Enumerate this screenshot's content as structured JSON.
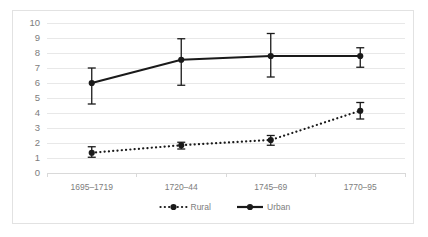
{
  "chart_data": {
    "type": "line",
    "title": "",
    "subtitle": "",
    "xlabel": "",
    "ylabel": "",
    "categories": [
      "1695–1719",
      "1720–44",
      "1745–69",
      "1770–95"
    ],
    "ylim": [
      0,
      10
    ],
    "ytick_step": 1,
    "yticks": [
      "0",
      "1",
      "2",
      "3",
      "4",
      "5",
      "6",
      "7",
      "8",
      "9",
      "10"
    ],
    "grid": true,
    "grid_axis": "y",
    "legend_position": "bottom",
    "series": [
      {
        "name": "Rural",
        "style": "dotted",
        "marker": "circle",
        "color": "#1a1a1a",
        "values": [
          1.35,
          1.85,
          2.2,
          4.15
        ],
        "err_low": [
          1.05,
          1.6,
          1.85,
          3.6
        ],
        "err_high": [
          1.75,
          2.05,
          2.5,
          4.7
        ]
      },
      {
        "name": "Urban",
        "style": "solid",
        "marker": "circle",
        "color": "#1a1a1a",
        "values": [
          6.0,
          7.55,
          7.8,
          7.8
        ],
        "err_low": [
          4.6,
          5.85,
          6.4,
          7.05
        ],
        "err_high": [
          7.0,
          8.95,
          9.3,
          8.35
        ]
      }
    ]
  },
  "legend": {
    "items": [
      {
        "label": "Rural",
        "style": "dotted"
      },
      {
        "label": "Urban",
        "style": "solid"
      }
    ]
  }
}
